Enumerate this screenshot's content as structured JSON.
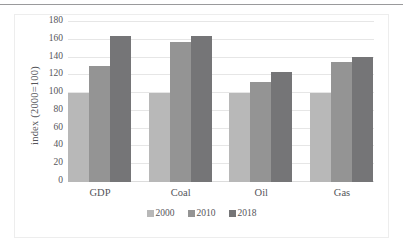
{
  "chart_data": {
    "type": "bar",
    "title": "",
    "subtitle": "",
    "xlabel": "",
    "ylabel": "index (2000=100)",
    "categories": [
      "GDP",
      "Coal",
      "Oil",
      "Gas"
    ],
    "series": [
      {
        "name": "2000",
        "color": "#b8b8b8",
        "values": [
          100,
          100,
          100,
          100
        ]
      },
      {
        "name": "2010",
        "color": "#949494",
        "values": [
          131,
          157,
          112,
          135
        ]
      },
      {
        "name": "2018",
        "color": "#757577",
        "values": [
          164,
          164,
          124,
          141
        ]
      }
    ],
    "ylim": [
      0,
      180
    ],
    "ytick_step": 20,
    "yticks": [
      0,
      20,
      40,
      60,
      80,
      100,
      120,
      140,
      160,
      180
    ],
    "ytick_labels": [
      "0",
      "20",
      "40",
      "60",
      "80",
      "100",
      "120",
      "140",
      "160",
      "180"
    ],
    "grid": true,
    "grid_axis": "y",
    "legend_position": "bottom",
    "grouping": "clustered"
  }
}
